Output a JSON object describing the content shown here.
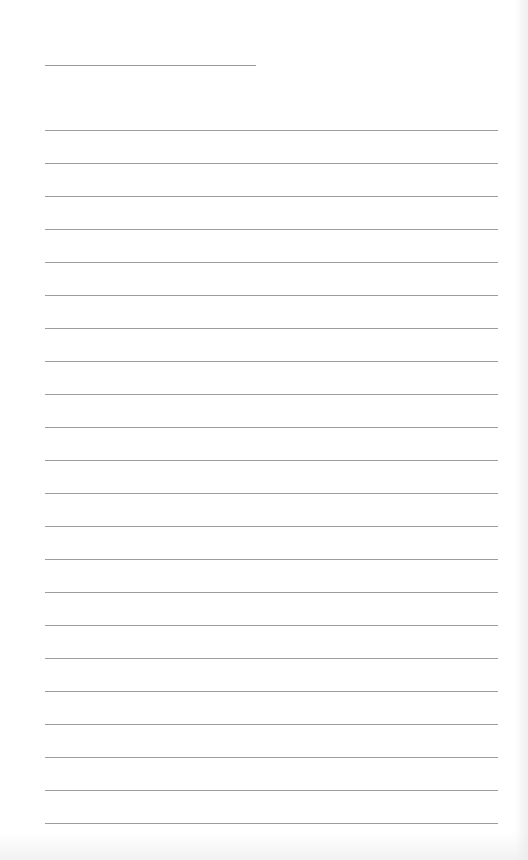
{
  "document": {
    "type": "lined-notepad-page",
    "title_line": {
      "x": 45,
      "y": 65,
      "width": 211
    },
    "rules": {
      "count": 22,
      "start_y": 130,
      "spacing": 33,
      "x": 45,
      "width": 453
    },
    "colors": {
      "paper": "#ffffff",
      "rule": "#9d9d9d"
    },
    "lines_text": [
      "",
      "",
      "",
      "",
      "",
      "",
      "",
      "",
      "",
      "",
      "",
      "",
      "",
      "",
      "",
      "",
      "",
      "",
      "",
      "",
      "",
      ""
    ]
  }
}
